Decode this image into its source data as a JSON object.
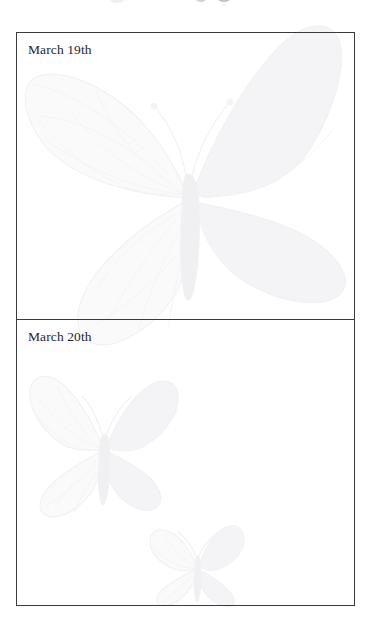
{
  "document": {
    "type": "handwriting-log-page",
    "background_color": "#ffffff",
    "page_width": 376,
    "page_height": 640
  },
  "table": {
    "name": "date-log-table",
    "border_color": "#3a3a3c",
    "border_width": 1,
    "rows": [
      {
        "id": "row-march-19",
        "date_label": "March 19th",
        "entry_text": "",
        "entry_placeholder": ""
      },
      {
        "id": "row-march-20",
        "date_label": "March 20th",
        "entry_text": "",
        "entry_placeholder": ""
      }
    ]
  },
  "watermarks": {
    "color": "#f3f3f5",
    "items": [
      {
        "name": "butterfly-watermark-large",
        "subject": "monarch butterfly",
        "position": "upper cell, centered-right",
        "size": "large"
      },
      {
        "name": "butterfly-watermark-medium",
        "subject": "monarch butterfly",
        "position": "lower cell, left",
        "size": "medium"
      },
      {
        "name": "butterfly-watermark-small",
        "subject": "monarch butterfly",
        "position": "lower cell, lower-center",
        "size": "small"
      }
    ]
  },
  "bleed_marks": {
    "name": "page-edge-bleed-marks",
    "count": 3,
    "color": "#c9c9cc"
  }
}
